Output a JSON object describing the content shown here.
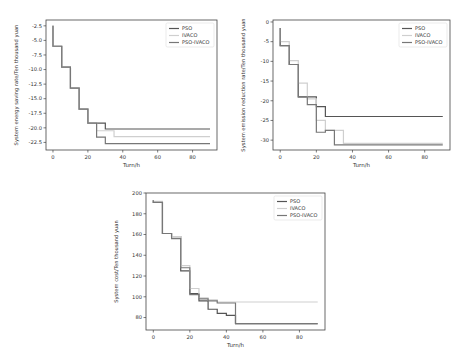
{
  "chart_data": [
    {
      "type": "line",
      "step": true,
      "title": "",
      "xlabel": "Turn/h",
      "ylabel": "System energy saving rate/Ten thousand yuan",
      "xlim": [
        -4,
        94
      ],
      "ylim": [
        -23.8,
        -1.5
      ],
      "xticks": [
        0,
        20,
        40,
        60,
        80
      ],
      "yticks": [
        -2.5,
        -5.0,
        -7.5,
        -10.0,
        -12.5,
        -15.0,
        -17.5,
        -20.0,
        -22.5
      ],
      "ytick_labels": [
        "-2.5",
        "-5.0",
        "-7.5",
        "-10.0",
        "-12.5",
        "-15.0",
        "-17.5",
        "-20.0",
        "-22.5"
      ],
      "legend": [
        "PSO",
        "IVACO",
        "PSO-IVACO"
      ],
      "legend_position": "upper right",
      "series": [
        {
          "name": "PSO",
          "color": "#555555",
          "x": [
            0,
            0,
            5,
            10,
            15,
            20,
            30,
            35,
            90
          ],
          "y": [
            -2.5,
            -6.0,
            -9.6,
            -13.2,
            -16.8,
            -19.2,
            -20.2,
            -20.2,
            -20.2
          ]
        },
        {
          "name": "IVACO",
          "color": "#cfcfcf",
          "x": [
            0,
            0,
            5,
            10,
            15,
            20,
            25,
            35,
            90
          ],
          "y": [
            -2.5,
            -6.0,
            -9.6,
            -13.2,
            -16.8,
            -19.2,
            -20.5,
            -21.5,
            -21.5
          ]
        },
        {
          "name": "PSO-IVACO",
          "color": "#777777",
          "x": [
            0,
            0,
            5,
            10,
            15,
            20,
            25,
            30,
            90
          ],
          "y": [
            -2.5,
            -6.0,
            -9.6,
            -13.2,
            -16.8,
            -19.2,
            -21.6,
            -22.7,
            -22.7
          ]
        }
      ]
    },
    {
      "type": "line",
      "step": true,
      "title": "",
      "xlabel": "Turn/h",
      "ylabel": "System emission reduction rate/Ten thousand yuan",
      "xlim": [
        -4,
        94
      ],
      "ylim": [
        -32.5,
        0.5
      ],
      "xticks": [
        0,
        20,
        40,
        60,
        80
      ],
      "yticks": [
        0,
        -5,
        -10,
        -15,
        -20,
        -25,
        -30
      ],
      "ytick_labels": [
        "0",
        "-5",
        "-10",
        "-15",
        "-20",
        "-25",
        "-30"
      ],
      "legend": [
        "PSO",
        "IVACO",
        "PSO-IVACO"
      ],
      "legend_position": "upper right",
      "series": [
        {
          "name": "PSO",
          "color": "#555555",
          "x": [
            0,
            0,
            5,
            10,
            15,
            20,
            25,
            90
          ],
          "y": [
            -1.5,
            -6.0,
            -10.8,
            -19.0,
            -19.0,
            -21.5,
            -24.0,
            -24.0
          ]
        },
        {
          "name": "IVACO",
          "color": "#cfcfcf",
          "x": [
            0,
            0,
            5,
            10,
            15,
            20,
            25,
            35,
            90
          ],
          "y": [
            -1.5,
            -5.0,
            -9.8,
            -15.5,
            -19.5,
            -25.0,
            -27.5,
            -30.8,
            -30.8
          ]
        },
        {
          "name": "PSO-IVACO",
          "color": "#777777",
          "x": [
            0,
            0,
            5,
            10,
            15,
            20,
            25,
            30,
            90
          ],
          "y": [
            -1.5,
            -6.0,
            -10.8,
            -19.0,
            -21.0,
            -28.0,
            -27.5,
            -31.2,
            -31.2
          ]
        }
      ]
    },
    {
      "type": "line",
      "step": true,
      "title": "",
      "xlabel": "Turn/h",
      "ylabel": "System cost/Ten thousand yuan",
      "xlim": [
        -4,
        94
      ],
      "ylim": [
        68,
        200
      ],
      "xticks": [
        0,
        20,
        40,
        60,
        80
      ],
      "yticks": [
        200,
        180,
        160,
        140,
        120,
        100,
        80
      ],
      "ytick_labels": [
        "200",
        "180",
        "160",
        "140",
        "120",
        "100",
        "80"
      ],
      "legend": [
        "PSO",
        "IVACO",
        "PSO-IVACO"
      ],
      "legend_position": "upper right",
      "series": [
        {
          "name": "PSO",
          "color": "#555555",
          "x": [
            0,
            0,
            5,
            10,
            15,
            20,
            25,
            30,
            35,
            40,
            45,
            90
          ],
          "y": [
            193,
            191,
            161,
            158,
            125,
            103,
            96,
            88,
            84,
            82,
            74,
            74
          ]
        },
        {
          "name": "IVACO",
          "color": "#cfcfcf",
          "x": [
            0,
            0,
            5,
            10,
            15,
            20,
            25,
            30,
            35,
            40,
            90
          ],
          "y": [
            193,
            192,
            161,
            158,
            130,
            108,
            99,
            97,
            95,
            95,
            95
          ]
        },
        {
          "name": "PSO-IVACO",
          "color": "#777777",
          "x": [
            0,
            0,
            5,
            10,
            15,
            20,
            25,
            30,
            35,
            40,
            45,
            90
          ],
          "y": [
            193,
            191,
            161,
            156,
            128,
            102,
            98,
            96,
            94,
            94,
            74,
            74
          ]
        }
      ]
    }
  ],
  "charts_layout": [
    {
      "left": 0,
      "top": 0,
      "width": 233,
      "height": 175,
      "plot": {
        "x0": 46,
        "y0": 20,
        "x1": 217,
        "y1": 150
      }
    },
    {
      "left": 233,
      "top": 0,
      "width": 233,
      "height": 175,
      "plot": {
        "x0": 40,
        "y0": 20,
        "x1": 217,
        "y1": 150
      }
    },
    {
      "left": 100,
      "top": 180,
      "width": 266,
      "height": 173,
      "plot": {
        "x0": 46,
        "y0": 13,
        "x1": 225,
        "y1": 150
      }
    }
  ]
}
